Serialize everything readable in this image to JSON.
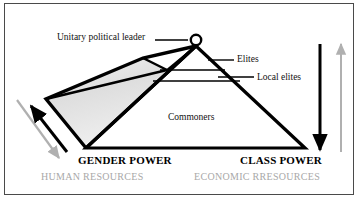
{
  "figure": {
    "type": "pyramid-hierarchy-diagram",
    "apex_marker": "open-circle",
    "labels": {
      "leader": "Unitary political leader",
      "elites": "Elites",
      "local_elites": "Local elites",
      "commoners": "Commoners"
    },
    "axes": {
      "left_title": "GENDER POWER",
      "left_subtitle": "HUMAN RESOURCES",
      "right_title": "CLASS POWER",
      "right_subtitle": "ECONOMIC RRESOURCES"
    },
    "arrows": {
      "left_black_direction": "up-left",
      "left_gray_direction": "down-right",
      "right_black_direction": "down",
      "right_gray_direction": "up"
    },
    "colors": {
      "ink": "#000000",
      "frame": "#4a4a4a",
      "shading": "#e3e3e3",
      "subtitle_text": "#a8a8a8",
      "gray_arrow": "#b0b0b0",
      "background": "#ffffff"
    }
  }
}
